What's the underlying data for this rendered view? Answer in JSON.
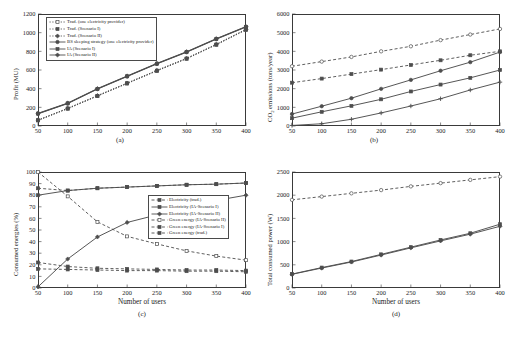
{
  "figure": {
    "xlabel": "Number of users",
    "panel_labels": {
      "a": "(a)",
      "b": "(b)",
      "c": "(c)",
      "d": "(d)"
    },
    "line_color": "#4d4d4d",
    "accent_color": "#2b2b2b"
  },
  "chart_data": [
    {
      "type": "line",
      "panel": "(a)",
      "title": "",
      "xlabel": "Number of users",
      "ylabel": "Profit (MU)",
      "x": [
        50,
        100,
        150,
        200,
        250,
        300,
        350,
        400
      ],
      "xlim": [
        50,
        400
      ],
      "ylim": [
        0,
        1200
      ],
      "xticks": [
        50,
        100,
        150,
        200,
        250,
        300,
        350,
        400
      ],
      "yticks": [
        0,
        200,
        400,
        600,
        800,
        1000,
        1200
      ],
      "grid": false,
      "legend_position": "upper-left",
      "series": [
        {
          "name": "Trad. (one electricity provider)",
          "style": "dotted",
          "marker": "square-open",
          "values": [
            60,
            185,
            320,
            455,
            590,
            720,
            870,
            1030
          ]
        },
        {
          "name": "Trad. (Scenario I)",
          "style": "dotted",
          "marker": "square-filled",
          "values": [
            62,
            188,
            323,
            458,
            593,
            723,
            873,
            1033
          ]
        },
        {
          "name": "Trad. (Scenario II)",
          "style": "dotted",
          "marker": "diamond",
          "values": [
            64,
            190,
            326,
            460,
            596,
            726,
            876,
            1036
          ]
        },
        {
          "name": "BS sleeping strategy (one electricity provider)",
          "style": "solid",
          "marker": "circle",
          "values": [
            130,
            240,
            395,
            530,
            665,
            790,
            930,
            1060
          ]
        },
        {
          "name": "IA (Scenario I)",
          "style": "solid",
          "marker": "square-filled",
          "values": [
            133,
            243,
            398,
            533,
            668,
            793,
            933,
            1063
          ]
        },
        {
          "name": "IA (Scenario II)",
          "style": "solid",
          "marker": "diamond",
          "values": [
            136,
            246,
            401,
            536,
            671,
            796,
            936,
            1066
          ]
        }
      ]
    },
    {
      "type": "line",
      "panel": "(b)",
      "title": "",
      "xlabel": "Number of users",
      "ylabel": "CO2 emissions (tons/year)",
      "x": [
        50,
        100,
        150,
        200,
        250,
        300,
        350,
        400
      ],
      "xlim": [
        50,
        400
      ],
      "ylim": [
        0,
        6000
      ],
      "xticks": [
        50,
        100,
        150,
        200,
        250,
        300,
        350,
        400
      ],
      "yticks": [
        0,
        1000,
        2000,
        3000,
        4000,
        5000,
        6000
      ],
      "grid": false,
      "legend_position": "none",
      "series": [
        {
          "name": "Trad. (one electricity provider)",
          "style": "dashed",
          "marker": "circle-open",
          "values": [
            3200,
            3450,
            3700,
            4000,
            4270,
            4600,
            4900,
            5200
          ]
        },
        {
          "name": "Trad. (Scenario I)",
          "style": "dashed",
          "marker": "square-filled",
          "values": [
            2320,
            2540,
            2780,
            3020,
            3270,
            3520,
            3790,
            4000
          ]
        },
        {
          "name": "BS sleeping (one electricity provider)",
          "style": "solid",
          "marker": "circle",
          "values": [
            640,
            1060,
            1490,
            1990,
            2470,
            2960,
            3420,
            3960
          ]
        },
        {
          "name": "IA (Scenario I)",
          "style": "solid",
          "marker": "square-filled",
          "values": [
            420,
            760,
            1080,
            1430,
            1850,
            2220,
            2580,
            3000
          ]
        },
        {
          "name": "IA (Scenario II)",
          "style": "solid",
          "marker": "plus",
          "values": [
            30,
            120,
            360,
            700,
            1070,
            1460,
            1930,
            2350
          ]
        }
      ]
    },
    {
      "type": "line",
      "panel": "(c)",
      "title": "",
      "xlabel": "Number of users",
      "ylabel": "Consumed energies (%)",
      "x": [
        50,
        100,
        150,
        200,
        250,
        300,
        350,
        400
      ],
      "xlim": [
        50,
        400
      ],
      "ylim": [
        0,
        100
      ],
      "xticks": [
        50,
        100,
        150,
        200,
        250,
        300,
        350,
        400
      ],
      "yticks": [
        0,
        10,
        20,
        30,
        40,
        50,
        60,
        70,
        80,
        90,
        100
      ],
      "grid": false,
      "legend_position": "center-right",
      "series": [
        {
          "name": "Electricity (trad.)",
          "style": "dashed",
          "marker": "square-filled",
          "values": [
            86,
            84,
            86,
            87,
            88,
            89,
            89.5,
            90.5
          ]
        },
        {
          "name": "Electricity (IA-Scenario I)",
          "style": "solid",
          "marker": "square-filled",
          "values": [
            80,
            84,
            86,
            87,
            88,
            89,
            89.5,
            90.5
          ]
        },
        {
          "name": "Electricity (IA-Scenario II)",
          "style": "solid",
          "marker": "diamond",
          "values": [
            1,
            25,
            44,
            56.5,
            63,
            70,
            75.5,
            80
          ]
        },
        {
          "name": "Green energy (IA-Scenario II)",
          "style": "dashed",
          "marker": "square-open",
          "values": [
            100,
            79,
            57,
            44.5,
            38,
            32,
            27.5,
            24
          ]
        },
        {
          "name": "Green energy (IA-Scenario I)",
          "style": "dashed",
          "marker": "square-filled",
          "values": [
            22,
            18.5,
            17,
            16.5,
            16,
            15.5,
            15.5,
            15
          ]
        },
        {
          "name": "Green energy (trad.)",
          "style": "dashed",
          "marker": "square-filled",
          "values": [
            16.5,
            16,
            15.5,
            15,
            15,
            14.5,
            14.5,
            14
          ]
        }
      ]
    },
    {
      "type": "line",
      "panel": "(d)",
      "title": "",
      "xlabel": "Number of users",
      "ylabel": "Total consumed power (W)",
      "x": [
        50,
        100,
        150,
        200,
        250,
        300,
        350,
        400
      ],
      "xlim": [
        50,
        400
      ],
      "ylim": [
        0,
        2500
      ],
      "xticks": [
        50,
        100,
        150,
        200,
        250,
        300,
        350,
        400
      ],
      "yticks": [
        0,
        500,
        1000,
        1500,
        2000,
        2500
      ],
      "grid": false,
      "legend_position": "none",
      "series": [
        {
          "name": "Trad. (one electricity provider)",
          "style": "dashed",
          "marker": "circle-open",
          "values": [
            1900,
            1970,
            2040,
            2110,
            2190,
            2260,
            2330,
            2400
          ]
        },
        {
          "name": "IA (Scenario I)",
          "style": "solid",
          "marker": "square-filled",
          "values": [
            300,
            440,
            570,
            725,
            880,
            1035,
            1180,
            1375
          ]
        },
        {
          "name": "IA (Scenario II)",
          "style": "solid",
          "marker": "diamond",
          "values": [
            295,
            430,
            560,
            710,
            865,
            1015,
            1160,
            1330
          ]
        }
      ]
    }
  ],
  "legends": {
    "panel_a": [
      {
        "label": "Trad. (one electricity provider)",
        "style": "dotted",
        "marker": "square-open"
      },
      {
        "label": "Trad. (Scenario I)",
        "style": "dotted",
        "marker": "square-filled"
      },
      {
        "label": "Trad. (Scenario II)",
        "style": "dotted",
        "marker": "diamond"
      },
      {
        "label": "BS sleeping strategy (one electricity provider)",
        "style": "solid",
        "marker": "circle"
      },
      {
        "label": "IA (Scenario I)",
        "style": "solid",
        "marker": "square-filled"
      },
      {
        "label": "IA (Scenario II)",
        "style": "solid",
        "marker": "diamond"
      }
    ],
    "panel_c": [
      {
        "label": "Electricity (trad.)",
        "style": "dashed",
        "marker": "square-filled"
      },
      {
        "label": "Electricity (IA-Scenario I)",
        "style": "solid",
        "marker": "square-filled"
      },
      {
        "label": "Electricity (IA-Scenario II)",
        "style": "solid",
        "marker": "diamond"
      },
      {
        "label": "Green energy (IA-Scenario II)",
        "style": "dashed",
        "marker": "square-open"
      },
      {
        "label": "Green energy (IA-Scenario I)",
        "style": "dashed",
        "marker": "square-filled"
      },
      {
        "label": "Green energy (trad.)",
        "style": "dashed",
        "marker": "square-filled"
      }
    ]
  },
  "axis_labels": {
    "a_y": "Profit (MU)",
    "b_y_pre": "CO",
    "b_y_sub": "2",
    "b_y_post": " emissions (tons/year)",
    "c_y": "Consumed energies (%)",
    "d_y": "Total consumed power (W)",
    "x": "Number of users"
  }
}
